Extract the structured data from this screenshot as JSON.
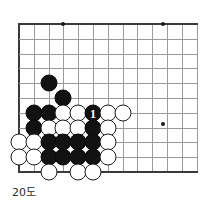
{
  "diagram": {
    "kind": "go-board-diagram",
    "caption": "20도",
    "board": {
      "origin_x": 19,
      "origin_y": 24,
      "spacing": 14.8,
      "cols": 13,
      "rows": 11,
      "edges": {
        "left": true,
        "top": true,
        "bottom": true,
        "right": false
      },
      "line_color": "#9a9a9a",
      "edge_color": "#3a3a3a"
    },
    "star_points": [
      {
        "col": 3,
        "row": 0
      },
      {
        "col": 9.7,
        "row": 0
      },
      {
        "col": 9.7,
        "row": 6.75
      }
    ],
    "stones": [
      {
        "col": 2,
        "row": 4,
        "color": "black",
        "label": ""
      },
      {
        "col": 3,
        "row": 5,
        "color": "black",
        "label": ""
      },
      {
        "col": 1,
        "row": 6,
        "color": "black",
        "label": ""
      },
      {
        "col": 2,
        "row": 6,
        "color": "black",
        "label": ""
      },
      {
        "col": 3,
        "row": 6,
        "color": "white",
        "label": ""
      },
      {
        "col": 4,
        "row": 6,
        "color": "white",
        "label": ""
      },
      {
        "col": 5,
        "row": 6,
        "color": "black",
        "label": "1"
      },
      {
        "col": 6,
        "row": 6,
        "color": "white",
        "label": ""
      },
      {
        "col": 7,
        "row": 6,
        "color": "white",
        "label": ""
      },
      {
        "col": 1,
        "row": 7,
        "color": "black",
        "label": ""
      },
      {
        "col": 2,
        "row": 7,
        "color": "white",
        "label": ""
      },
      {
        "col": 3,
        "row": 7,
        "color": "white",
        "label": ""
      },
      {
        "col": 4,
        "row": 7,
        "color": "white",
        "label": ""
      },
      {
        "col": 5,
        "row": 7,
        "color": "black",
        "label": ""
      },
      {
        "col": 6,
        "row": 7,
        "color": "white",
        "label": ""
      },
      {
        "col": 0,
        "row": 8,
        "color": "white",
        "label": ""
      },
      {
        "col": 1,
        "row": 8,
        "color": "white",
        "label": ""
      },
      {
        "col": 2,
        "row": 8,
        "color": "black",
        "label": ""
      },
      {
        "col": 3,
        "row": 8,
        "color": "black",
        "label": ""
      },
      {
        "col": 4,
        "row": 8,
        "color": "black",
        "label": ""
      },
      {
        "col": 5,
        "row": 8,
        "color": "black",
        "label": ""
      },
      {
        "col": 6,
        "row": 8,
        "color": "white",
        "label": ""
      },
      {
        "col": 0,
        "row": 9,
        "color": "white",
        "label": ""
      },
      {
        "col": 1,
        "row": 9,
        "color": "white",
        "label": ""
      },
      {
        "col": 2,
        "row": 9,
        "color": "black",
        "label": ""
      },
      {
        "col": 3,
        "row": 9,
        "color": "black",
        "label": ""
      },
      {
        "col": 4,
        "row": 9,
        "color": "black",
        "label": ""
      },
      {
        "col": 5,
        "row": 9,
        "color": "black",
        "label": ""
      },
      {
        "col": 6,
        "row": 9,
        "color": "white",
        "label": ""
      },
      {
        "col": 2,
        "row": 10,
        "color": "white",
        "label": ""
      },
      {
        "col": 4,
        "row": 10,
        "color": "white",
        "label": ""
      },
      {
        "col": 5,
        "row": 10,
        "color": "white",
        "label": ""
      }
    ]
  }
}
